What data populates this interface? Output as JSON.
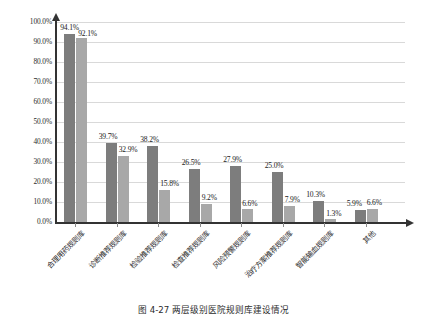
{
  "chart_data": {
    "type": "bar",
    "title": "",
    "subtitle": "",
    "xlabel": "",
    "ylabel": "",
    "ylim": [
      0,
      100
    ],
    "ytick_step": 10,
    "grid": true,
    "legend": "none",
    "orientation": "vertical",
    "value_suffix": "%",
    "categories": [
      "合理用药规则库",
      "诊断推荐规则库",
      "检验推荐规则库",
      "检查推荐规则库",
      "风险预警规则库",
      "治疗方案推荐规则库",
      "智能输血规则库",
      "其他"
    ],
    "ytick_labels": [
      "100.0%",
      "90.0%",
      "80.0%",
      "70.0%",
      "60.0%",
      "50.0%",
      "40.0%",
      "30.0%",
      "20.0%",
      "10.0%",
      "0.0%"
    ],
    "series": [
      {
        "name": "series-1",
        "color": "#7d7d7d",
        "values": [
          94.1,
          39.7,
          38.2,
          26.5,
          27.9,
          25.0,
          10.3,
          5.9
        ],
        "labels": [
          "94.1%",
          "39.7%",
          "38.2%",
          "26.5%",
          "27.9%",
          "25.0%",
          "10.3%",
          "5.9%"
        ]
      },
      {
        "name": "series-2",
        "color": "#a8a8a8",
        "values": [
          92.1,
          32.9,
          15.8,
          9.2,
          6.6,
          7.9,
          1.3,
          6.6
        ],
        "labels": [
          "92.1%",
          "32.9%",
          "15.8%",
          "9.2%",
          "6.6%",
          "7.9%",
          "1.3%",
          "6.6%"
        ]
      }
    ]
  },
  "caption": {
    "text": "图 4-27  两层级别医院规则库建设情况"
  }
}
